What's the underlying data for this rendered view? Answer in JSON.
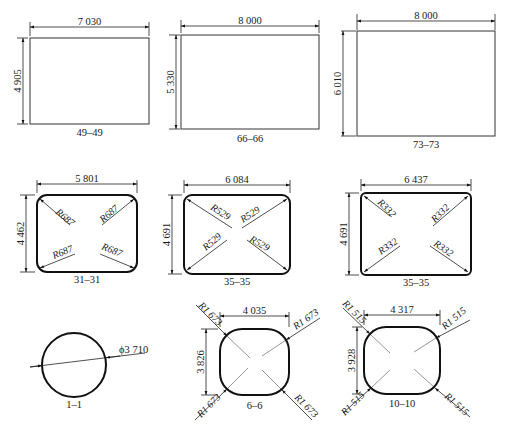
{
  "sections": [
    {
      "id": "49-49",
      "label": "49–49",
      "shape": "rectangle",
      "width_dim": "7 030",
      "height_dim": "4 905"
    },
    {
      "id": "66-66",
      "label": "66–66",
      "shape": "rectangle",
      "width_dim": "8 000",
      "height_dim": "5 330"
    },
    {
      "id": "73-73",
      "label": "73–73",
      "shape": "rectangle",
      "width_dim": "8 000",
      "height_dim": "6 010"
    },
    {
      "id": "31-31",
      "label": "31–31",
      "shape": "rounded-rectangle",
      "width_dim": "5 801",
      "height_dim": "4 462",
      "radius": "R687"
    },
    {
      "id": "35-35a",
      "label": "35–35",
      "shape": "rounded-rectangle",
      "width_dim": "6 084",
      "height_dim": "4 563",
      "radius": "R529"
    },
    {
      "id": "35-35b",
      "label": "35–35",
      "shape": "rounded-rectangle",
      "width_dim": "6 437",
      "height_dim": "4 691",
      "radius": "R332"
    },
    {
      "id": "1-1",
      "label": "1–1",
      "shape": "circle",
      "diameter": "ϕ3 710"
    },
    {
      "id": "6-6",
      "label": "6–6",
      "shape": "rounded-square",
      "width_dim": "4 035",
      "height_dim": "3 826",
      "radius": "R1 673"
    },
    {
      "id": "10-10",
      "label": "10–10",
      "shape": "rounded-square",
      "width_dim": "4 317",
      "height_dim": "3 928",
      "radius": "R1 515"
    }
  ]
}
